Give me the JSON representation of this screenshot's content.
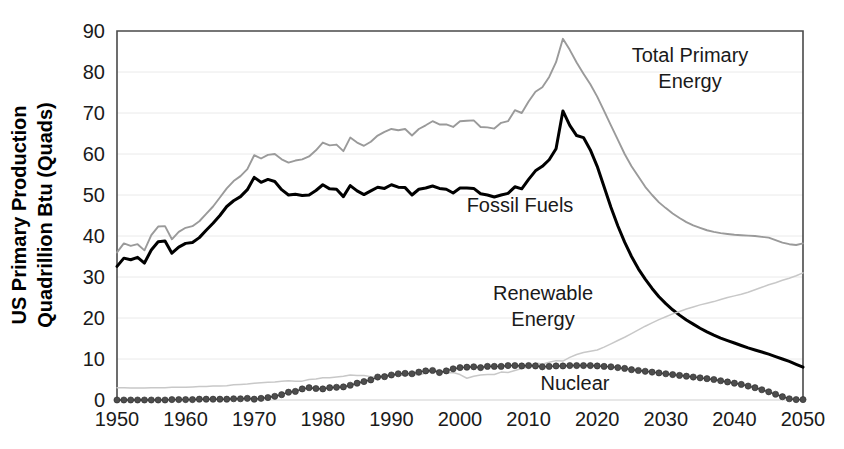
{
  "chart_data": {
    "type": "line",
    "title": "",
    "xlabel": "",
    "ylabel": "US Primary Production Quadrillion Btu (Quads)",
    "ylabel_line1": "US Primary Production",
    "ylabel_line2": "Quadrillion Btu (Quads)",
    "xlim": [
      1950,
      2050
    ],
    "ylim": [
      0,
      90
    ],
    "xticks": [
      1950,
      1960,
      1970,
      1980,
      1990,
      2000,
      2010,
      2020,
      2030,
      2040,
      2050
    ],
    "yticks": [
      0,
      10,
      20,
      30,
      40,
      50,
      60,
      70,
      80,
      90
    ],
    "grid": true,
    "legend_position": "inline-annotations",
    "annotations": [
      {
        "label": "Total Primary Energy",
        "line1": "Total Primary",
        "line2": "Energy",
        "x": 690,
        "y": 62,
        "series": "total_primary_energy"
      },
      {
        "label": "Fossil Fuels",
        "line1": "Fossil Fuels",
        "line2": "",
        "x": 520,
        "y": 212,
        "series": "fossil_fuels"
      },
      {
        "label": "Renewable Energy",
        "line1": "Renewable",
        "line2": "Energy",
        "x": 543,
        "y": 300,
        "series": "renewable_energy"
      },
      {
        "label": "Nuclear",
        "line1": "Nuclear",
        "line2": "",
        "x": 575,
        "y": 390,
        "series": "nuclear"
      }
    ],
    "colors": {
      "total_primary_energy": "#9a9a9a",
      "fossil_fuels": "#000000",
      "renewable_energy": "#c8c8c8",
      "nuclear": "#4d4d4d",
      "gridline": "#eaeaea",
      "axis": "#4a4a4a",
      "text": "#1a1a1a",
      "background": "#ffffff"
    },
    "x": [
      1950,
      1951,
      1952,
      1953,
      1954,
      1955,
      1956,
      1957,
      1958,
      1959,
      1960,
      1961,
      1962,
      1963,
      1964,
      1965,
      1966,
      1967,
      1968,
      1969,
      1970,
      1971,
      1972,
      1973,
      1974,
      1975,
      1976,
      1977,
      1978,
      1979,
      1980,
      1981,
      1982,
      1983,
      1984,
      1985,
      1986,
      1987,
      1988,
      1989,
      1990,
      1991,
      1992,
      1993,
      1994,
      1995,
      1996,
      1997,
      1998,
      1999,
      2000,
      2001,
      2002,
      2003,
      2004,
      2005,
      2006,
      2007,
      2008,
      2009,
      2010,
      2011,
      2012,
      2013,
      2014,
      2015,
      2016,
      2017,
      2018,
      2019,
      2020,
      2021,
      2022,
      2023,
      2024,
      2025,
      2026,
      2027,
      2028,
      2029,
      2030,
      2031,
      2032,
      2033,
      2034,
      2035,
      2036,
      2037,
      2038,
      2039,
      2040,
      2041,
      2042,
      2043,
      2044,
      2045,
      2046,
      2047,
      2048,
      2049,
      2050
    ],
    "series": [
      {
        "name": "Total Primary Energy",
        "key": "total_primary_energy",
        "style": "solid-thin",
        "color": "#9a9a9a",
        "values": [
          36.0,
          38.2,
          37.6,
          38.0,
          36.5,
          40.2,
          42.3,
          42.4,
          39.2,
          41.0,
          42.0,
          42.4,
          43.6,
          45.4,
          47.2,
          49.4,
          51.6,
          53.4,
          54.6,
          56.3,
          59.7,
          58.9,
          59.8,
          60.0,
          58.7,
          57.9,
          58.4,
          58.7,
          59.4,
          60.9,
          62.8,
          62.1,
          62.3,
          60.7,
          64.0,
          62.8,
          62.0,
          63.0,
          64.5,
          65.4,
          66.1,
          65.8,
          66.1,
          64.5,
          66.1,
          67.0,
          68.0,
          67.2,
          67.2,
          66.6,
          68.0,
          68.1,
          68.2,
          66.6,
          66.5,
          66.2,
          67.6,
          68.0,
          70.7,
          70.0,
          72.8,
          75.2,
          76.3,
          78.8,
          82.4,
          88.1,
          85.4,
          82.3,
          79.6,
          77.0,
          74.0,
          70.5,
          67.0,
          63.5,
          60.0,
          57.0,
          54.5,
          52.0,
          50.0,
          48.2,
          46.8,
          45.5,
          44.4,
          43.4,
          42.6,
          42.0,
          41.4,
          41.0,
          40.7,
          40.5,
          40.3,
          40.2,
          40.1,
          40.0,
          39.8,
          39.6,
          39.0,
          38.4,
          38.0,
          37.8,
          38.2
        ]
      },
      {
        "name": "Fossil Fuels",
        "key": "fossil_fuels",
        "style": "solid-thick",
        "color": "#000000",
        "values": [
          32.6,
          34.6,
          34.2,
          34.8,
          33.4,
          36.6,
          38.6,
          38.8,
          35.8,
          37.3,
          38.2,
          38.4,
          39.6,
          41.4,
          43.1,
          45.0,
          47.2,
          48.6,
          49.6,
          51.3,
          54.3,
          53.1,
          53.8,
          53.3,
          51.3,
          50.0,
          50.2,
          49.9,
          50.0,
          51.1,
          52.5,
          51.5,
          51.4,
          49.6,
          52.3,
          51.0,
          50.1,
          51.0,
          51.9,
          51.6,
          52.5,
          51.9,
          51.8,
          50.0,
          51.4,
          51.7,
          52.2,
          51.6,
          51.4,
          50.5,
          51.7,
          51.7,
          51.6,
          50.3,
          50.0,
          49.5,
          50.0,
          50.4,
          52.0,
          51.5,
          53.8,
          55.9,
          57.0,
          58.6,
          61.3,
          70.5,
          67.0,
          64.5,
          64.0,
          61.0,
          57.0,
          52.0,
          47.0,
          42.5,
          38.5,
          35.0,
          32.0,
          29.5,
          27.2,
          25.2,
          23.5,
          22.0,
          20.7,
          19.5,
          18.5,
          17.5,
          16.6,
          15.8,
          15.1,
          14.5,
          13.9,
          13.3,
          12.7,
          12.2,
          11.7,
          11.2,
          10.6,
          10.0,
          9.4,
          8.7,
          8.0
        ]
      },
      {
        "name": "Renewable Energy",
        "key": "renewable_energy",
        "style": "solid-thin-light",
        "color": "#c8c8c8",
        "values": [
          3.0,
          3.0,
          2.9,
          2.9,
          2.9,
          3.0,
          3.0,
          3.0,
          3.1,
          3.1,
          3.1,
          3.2,
          3.3,
          3.3,
          3.4,
          3.4,
          3.5,
          3.7,
          3.8,
          3.9,
          4.1,
          4.2,
          4.3,
          4.4,
          4.6,
          4.7,
          4.6,
          4.6,
          5.0,
          5.1,
          5.4,
          5.4,
          5.6,
          5.8,
          6.1,
          6.0,
          6.0,
          5.7,
          5.5,
          6.2,
          6.0,
          6.1,
          6.0,
          6.2,
          6.1,
          6.6,
          7.2,
          7.2,
          6.6,
          6.7,
          6.2,
          5.3,
          5.8,
          6.1,
          6.2,
          6.2,
          6.8,
          6.7,
          7.2,
          7.7,
          8.1,
          9.1,
          8.7,
          9.2,
          9.6,
          9.5,
          10.4,
          11.1,
          11.6,
          11.9,
          12.2,
          12.9,
          13.7,
          14.5,
          15.3,
          16.2,
          17.1,
          18.0,
          18.8,
          19.6,
          20.3,
          21.0,
          21.6,
          22.2,
          22.7,
          23.2,
          23.6,
          24.0,
          24.5,
          25.0,
          25.4,
          25.8,
          26.3,
          26.9,
          27.5,
          28.1,
          28.6,
          29.2,
          29.7,
          30.3,
          31.0
        ]
      },
      {
        "name": "Nuclear",
        "key": "nuclear",
        "style": "markers",
        "color": "#4d4d4d",
        "values": [
          0.0,
          0.0,
          0.0,
          0.0,
          0.0,
          0.0,
          0.0,
          0.0,
          0.1,
          0.1,
          0.1,
          0.1,
          0.2,
          0.2,
          0.2,
          0.2,
          0.2,
          0.3,
          0.3,
          0.4,
          0.2,
          0.4,
          0.6,
          0.9,
          1.3,
          1.9,
          2.1,
          2.7,
          3.0,
          2.8,
          2.7,
          3.0,
          3.1,
          3.2,
          3.6,
          4.1,
          4.5,
          4.9,
          5.6,
          5.7,
          6.1,
          6.4,
          6.5,
          6.4,
          6.8,
          7.1,
          7.2,
          6.7,
          7.1,
          7.6,
          7.9,
          8.0,
          8.1,
          7.9,
          8.2,
          8.2,
          8.2,
          8.4,
          8.4,
          8.3,
          8.4,
          8.3,
          8.1,
          8.2,
          8.3,
          8.3,
          8.4,
          8.4,
          8.4,
          8.4,
          8.3,
          8.2,
          8.1,
          7.9,
          7.7,
          7.4,
          7.2,
          7.0,
          6.8,
          6.6,
          6.4,
          6.2,
          6.0,
          5.8,
          5.6,
          5.4,
          5.2,
          5.0,
          4.7,
          4.4,
          4.1,
          3.8,
          3.4,
          3.0,
          2.5,
          2.0,
          1.4,
          0.8,
          0.3,
          0.1,
          0.1
        ]
      }
    ]
  }
}
